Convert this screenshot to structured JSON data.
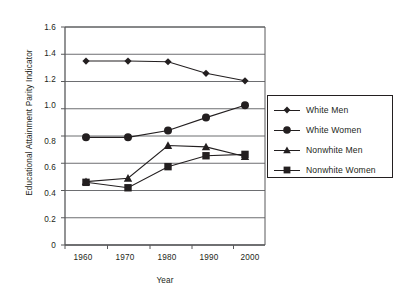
{
  "chart_data": {
    "type": "line",
    "title": "",
    "xlabel": "Year",
    "ylabel": "Educational Attainment Parity Indicator",
    "x": [
      1960,
      1970,
      1980,
      1990,
      2000
    ],
    "xtick_labels": [
      "1960",
      "1970",
      "1980",
      "1990",
      "2000"
    ],
    "ytick_labels": [
      "0",
      "0.2",
      "0.4",
      "0.6",
      "0.8",
      "1.0",
      "1.2",
      "1.4",
      "1.6"
    ],
    "ytick_values": [
      0,
      0.2,
      0.4,
      0.6,
      0.8,
      1.0,
      1.2,
      1.4,
      1.6
    ],
    "xlim": [
      1955,
      2005
    ],
    "ylim": [
      0,
      1.6
    ],
    "grid": "horizontal",
    "legend_position": "right-middle",
    "series": [
      {
        "name": "White Men",
        "marker": "diamond",
        "color": "#231f20",
        "values": [
          1.35,
          1.35,
          1.345,
          1.26,
          1.205
        ]
      },
      {
        "name": "White Women",
        "marker": "circle",
        "color": "#231f20",
        "values": [
          0.79,
          0.79,
          0.84,
          0.935,
          1.025
        ]
      },
      {
        "name": "Nonwhite Men",
        "marker": "triangle",
        "color": "#231f20",
        "values": [
          0.465,
          0.49,
          0.73,
          0.72,
          0.65
        ]
      },
      {
        "name": "Nonwhite Women",
        "marker": "square",
        "color": "#231f20",
        "values": [
          0.46,
          0.42,
          0.575,
          0.655,
          0.665
        ]
      }
    ]
  },
  "legend": {
    "items": [
      {
        "label": "White Men",
        "marker": "diamond"
      },
      {
        "label": "White Women",
        "marker": "circle"
      },
      {
        "label": "Nonwhite Men",
        "marker": "triangle"
      },
      {
        "label": "Nonwhite Women",
        "marker": "square"
      }
    ]
  },
  "colors": {
    "ink": "#231f20",
    "grid": "#6d6e71",
    "frame": "#58595b",
    "background": "#ffffff"
  }
}
